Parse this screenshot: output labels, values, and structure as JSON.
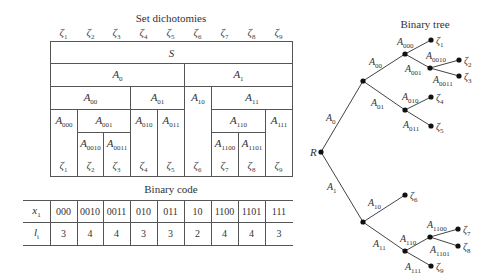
{
  "set_dichotomies": {
    "title": "Set dichotomies",
    "top_labels": [
      "ζ1",
      "ζ2",
      "ζ3",
      "ζ4",
      "ζ5",
      "ζ6",
      "ζ7",
      "ζ8",
      "ζ9"
    ],
    "bottom_labels": [
      "ζ1",
      "ζ2",
      "ζ3",
      "ζ4",
      "ζ5",
      "ζ6",
      "ζ7",
      "ζ8",
      "ζ9"
    ],
    "root": "S",
    "level1": [
      "A0",
      "A1"
    ],
    "level2": [
      "A00",
      "A01",
      "A10",
      "A11"
    ],
    "level3": [
      "A000",
      "A001",
      "A010",
      "A011",
      "A110",
      "A111"
    ],
    "level4": [
      "A0010",
      "A0011",
      "A1100",
      "A1101"
    ]
  },
  "binary_code": {
    "title": "Binary code",
    "row_x_label": "x1",
    "row_l_label": "li",
    "codes": [
      "000",
      "0010",
      "0011",
      "010",
      "011",
      "10",
      "1100",
      "1101",
      "111"
    ],
    "lengths": [
      "3",
      "4",
      "4",
      "3",
      "3",
      "2",
      "4",
      "4",
      "3"
    ]
  },
  "binary_tree": {
    "title": "Binary tree",
    "root_label": "R",
    "edges": [
      "A0",
      "A1",
      "A00",
      "A01",
      "A10",
      "A11",
      "A000",
      "A001",
      "A010",
      "A011",
      "A0010",
      "A0011",
      "A110",
      "A111",
      "A1100",
      "A1101"
    ],
    "leaves": [
      "ζ1",
      "ζ2",
      "ζ3",
      "ζ4",
      "ζ5",
      "ζ6",
      "ζ7",
      "ζ8",
      "ζ9"
    ]
  }
}
